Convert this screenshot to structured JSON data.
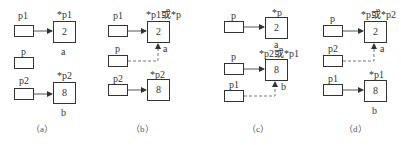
{
  "panels": [
    {
      "caption": "（a）",
      "pointers": [
        {
          "name": "p1"
        },
        {
          "name": "p"
        },
        {
          "name": "p2"
        }
      ],
      "targets": [
        {
          "label_top": "*p1",
          "value": "2",
          "label_bottom": "a"
        },
        {
          "label_top": "*p2",
          "value": "8",
          "label_bottom": "b"
        }
      ]
    },
    {
      "caption": "（b）",
      "pointers": [
        {
          "name": "p1"
        },
        {
          "name": "p"
        },
        {
          "name": "p2"
        }
      ],
      "targets": [
        {
          "label_top": "*p1或*p",
          "value": "2",
          "label_bottom": "a"
        },
        {
          "label_top": "*p2",
          "value": "8",
          "label_bottom": ""
        }
      ]
    },
    {
      "caption": "（c）",
      "pointers": [
        {
          "name": "p"
        },
        {
          "name": "p"
        },
        {
          "name": "p1"
        }
      ],
      "targets": [
        {
          "label_top": "*p",
          "value": "2",
          "label_bottom": "a"
        },
        {
          "label_top": "*p2或*p1",
          "value": "8",
          "label_bottom": "b"
        }
      ]
    },
    {
      "caption": "（d）",
      "pointers": [
        {
          "name": "p"
        },
        {
          "name": "p2"
        },
        {
          "name": "p1"
        }
      ],
      "targets": [
        {
          "label_top": "*p或*p2",
          "value": "2",
          "label_bottom": "a"
        },
        {
          "label_top": "*p1",
          "value": "8",
          "label_bottom": "b"
        }
      ]
    }
  ],
  "colors": {
    "line": "#333333",
    "dashed": "#666666"
  }
}
